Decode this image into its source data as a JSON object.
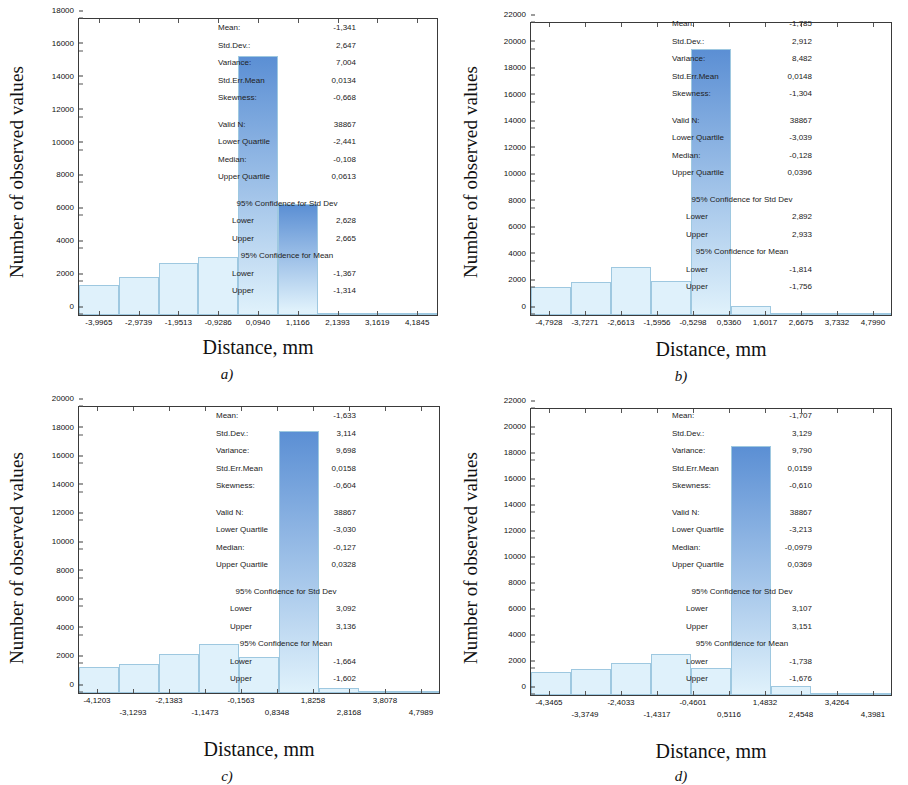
{
  "common": {
    "ylabel": "Number of observed values",
    "xlabel": "Distance, mm",
    "stat_labels": {
      "mean": "Mean:",
      "stddev": "Std.Dev.:",
      "variance": "Variance:",
      "stderr": "Std.Err.Mean",
      "skewness": "Skewness:",
      "validn": "Valid N:",
      "lowerq": "Lower Quartile",
      "median": "Median:",
      "upperq": "Upper Quartile",
      "ci_std_hdr": "95% Confidence for Std Dev",
      "ci_mean_hdr": "95% Confidence for Mean",
      "lower": "Lower",
      "upper": "Upper"
    },
    "colors": {
      "bar_top": "#5b8fd4",
      "bar_bottom": "#dff1fb",
      "bar_edge": "#9ec8e0",
      "axis": "#3a3a3a",
      "text": "#1a1a1a"
    }
  },
  "chart_data": [
    {
      "id": "a",
      "type": "bar",
      "caption": "a)",
      "title": "",
      "xlabel": "Distance, mm",
      "ylabel": "Number of observed values",
      "grid": false,
      "ylim": [
        0,
        18000
      ],
      "yticks": [
        0,
        2000,
        4000,
        6000,
        8000,
        10000,
        12000,
        14000,
        16000,
        18000
      ],
      "xticks": [
        "-3,9965",
        "-2,9739",
        "-1,9513",
        "-0,9286",
        "0,0940",
        "1,1166",
        "2,1393",
        "3,1619",
        "4,1845"
      ],
      "xtick_rows": 1,
      "categories": [
        "-3,9965",
        "-2,9739",
        "-1,9513",
        "-0,9286",
        "0,0940",
        "1,1166",
        "2,1393",
        "3,1619",
        "4,1845"
      ],
      "values": [
        1800,
        2300,
        3150,
        3500,
        15750,
        6750,
        120,
        40,
        20
      ],
      "stats": {
        "mean": "-1,341",
        "stddev": "2,647",
        "variance": "7,004",
        "stderr": "0,0134",
        "skewness": "-0,668",
        "validn": "38867",
        "lowerq": "-2,441",
        "median": "-0,108",
        "upperq": "0,0613",
        "ci_std_lower": "2,628",
        "ci_std_upper": "2,665",
        "ci_mean_lower": "-1,367",
        "ci_mean_upper": "-1,314"
      }
    },
    {
      "id": "b",
      "type": "bar",
      "caption": "b)",
      "title": "",
      "xlabel": "Distance, mm",
      "ylabel": "Number of observed values",
      "grid": false,
      "ylim": [
        0,
        22000
      ],
      "yticks": [
        0,
        2000,
        4000,
        6000,
        8000,
        10000,
        12000,
        14000,
        16000,
        18000,
        20000,
        22000
      ],
      "xticks": [
        "-4,7928",
        "-3,7271",
        "-2,6613",
        "-1,5956",
        "-0,5298",
        "0,5360",
        "1,6017",
        "2,6675",
        "3,7332",
        "4,7990"
      ],
      "xtick_rows": 1,
      "categories": [
        "-4,7928",
        "-3,7271",
        "-2,6613",
        "-1,5956",
        "-0,5298",
        "0,5360",
        "1,6017",
        "2,6675",
        "3,7332",
        "4,7990"
      ],
      "values": [
        2100,
        2500,
        3650,
        2550,
        20050,
        700,
        60,
        30,
        15
      ],
      "stats": {
        "mean": "-1,785",
        "stddev": "2,912",
        "variance": "8,482",
        "stderr": "0,0148",
        "skewness": "-1,304",
        "validn": "38867",
        "lowerq": "-3,039",
        "median": "-0,128",
        "upperq": "0,0396",
        "ci_std_lower": "2,892",
        "ci_std_upper": "2,933",
        "ci_mean_lower": "-1,814",
        "ci_mean_upper": "-1,756"
      }
    },
    {
      "id": "c",
      "type": "bar",
      "caption": "c)",
      "title": "",
      "xlabel": "Distance, mm",
      "ylabel": "Number of observed values",
      "grid": false,
      "ylim": [
        0,
        20000
      ],
      "yticks": [
        0,
        2000,
        4000,
        6000,
        8000,
        10000,
        12000,
        14000,
        16000,
        18000,
        20000
      ],
      "xticks": [
        "-4,1203",
        "-3,1293",
        "-2,1383",
        "-1,1473",
        "-0,1563",
        "0,8348",
        "1,8258",
        "2,8168",
        "3,8078",
        "4,7989"
      ],
      "xtick_rows": 2,
      "categories": [
        "-4,1203",
        "-3,1293",
        "-2,1383",
        "-1,1473",
        "-0,1563",
        "0,8348",
        "1,8258",
        "2,8168",
        "3,8078",
        "4,7989"
      ],
      "values": [
        1800,
        2050,
        2750,
        3400,
        2500,
        18350,
        330,
        70,
        30
      ],
      "stats": {
        "mean": "-1,633",
        "stddev": "3,114",
        "variance": "9,698",
        "stderr": "0,0158",
        "skewness": "-0,604",
        "validn": "38867",
        "lowerq": "-3,030",
        "median": "-0,127",
        "upperq": "0,0328",
        "ci_std_lower": "3,092",
        "ci_std_upper": "3,136",
        "ci_mean_lower": "-1,664",
        "ci_mean_upper": "-1,602"
      }
    },
    {
      "id": "d",
      "type": "bar",
      "caption": "d)",
      "title": "",
      "xlabel": "Distance, mm",
      "ylabel": "Number of observed values",
      "grid": false,
      "ylim": [
        0,
        22000
      ],
      "yticks": [
        0,
        2000,
        4000,
        6000,
        8000,
        10000,
        12000,
        14000,
        16000,
        18000,
        20000,
        22000
      ],
      "xticks": [
        "-4,3465",
        "-3,3749",
        "-2,4033",
        "-1,4317",
        "-0,4601",
        "0,5116",
        "1,4832",
        "2,4548",
        "3,4264",
        "4,3981"
      ],
      "xtick_rows": 2,
      "categories": [
        "-4,3465",
        "-3,3749",
        "-2,4033",
        "-1,4317",
        "-0,4601",
        "0,5116",
        "1,4832",
        "2,4548",
        "3,4264",
        "4,3981"
      ],
      "values": [
        1750,
        2000,
        2450,
        3150,
        2050,
        19150,
        700,
        60,
        25
      ],
      "stats": {
        "mean": "-1,707",
        "stddev": "3,129",
        "variance": "9,790",
        "stderr": "0,0159",
        "skewness": "-0,610",
        "validn": "38867",
        "lowerq": "-3,213",
        "median": "-0,0979",
        "upperq": "0,0369",
        "ci_std_lower": "3,107",
        "ci_std_upper": "3,151",
        "ci_mean_lower": "-1,738",
        "ci_mean_upper": "-1,676"
      }
    }
  ]
}
